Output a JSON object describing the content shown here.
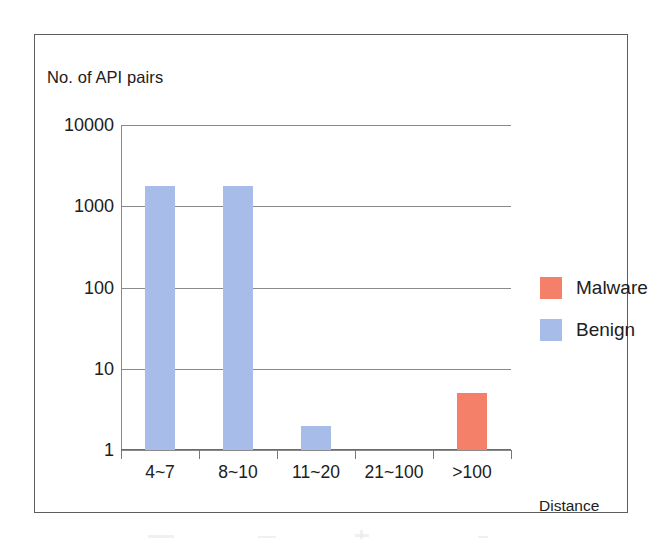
{
  "chart_data": {
    "type": "bar",
    "title": "",
    "xlabel": "Distance",
    "ylabel": "No. of API pairs",
    "yscale": "log",
    "ylim": [
      1,
      10000
    ],
    "ytick_labels": [
      "10000",
      "1000",
      "100",
      "10",
      "1"
    ],
    "ytick_values": [
      10000,
      1000,
      100,
      10,
      1
    ],
    "grid": true,
    "legend_position": "right",
    "categories": [
      "4~7",
      "8~10",
      "11~20",
      "21~100",
      ">100"
    ],
    "series": [
      {
        "name": "Malware",
        "color": "#f4806a",
        "values": [
          0,
          0,
          0,
          0,
          5
        ]
      },
      {
        "name": "Benign",
        "color": "#a8bce9",
        "values": [
          1800,
          1800,
          2,
          0,
          0
        ]
      }
    ],
    "bars": [
      {
        "category": "4~7",
        "series": "Benign",
        "value": 1800,
        "color": "#a8bce9"
      },
      {
        "category": "8~10",
        "series": "Benign",
        "value": 1800,
        "color": "#a8bce9"
      },
      {
        "category": "11~20",
        "series": "Benign",
        "value": 2,
        "color": "#a8bce9"
      },
      {
        "category": "21~100",
        "series": "none",
        "value": 0,
        "color": "#a8bce9"
      },
      {
        "category": ">100",
        "series": "Malware",
        "value": 5,
        "color": "#f4806a"
      }
    ]
  },
  "legend": {
    "entries": [
      {
        "label": "Malware",
        "color": "#f4806a"
      },
      {
        "label": "Benign",
        "color": "#a8bce9"
      }
    ]
  },
  "colors": {
    "malware": "#f4806a",
    "benign": "#a8bce9",
    "frame": "#5d5d5d",
    "gridline": "#8a8a8a",
    "text": "#202020"
  }
}
